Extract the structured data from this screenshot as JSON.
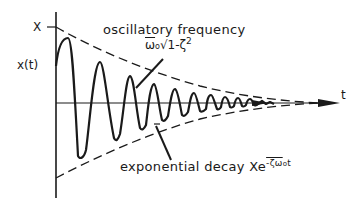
{
  "figure": {
    "axes": {
      "y_label": "x(t)",
      "y_tick_label": "X",
      "x_label": "t"
    },
    "annotations": {
      "oscillatory": {
        "label": "oscillatory frequency",
        "formula_base": "ω",
        "formula_sub": "o",
        "formula_rest": "√1-ζ",
        "formula_exp": "2"
      },
      "decay": {
        "label": "exponential decay",
        "formula_base": "Xe",
        "formula_exp": "-ζω",
        "formula_exp_sub": "o",
        "formula_exp_t": "t"
      }
    },
    "colors": {
      "ink": "#1a1a1a",
      "background": "#ffffff"
    }
  }
}
